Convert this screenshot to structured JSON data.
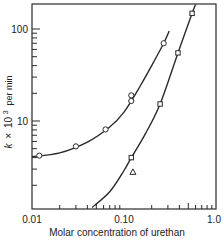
{
  "chart_data": {
    "type": "scatter",
    "title": "",
    "xlabel": "Molar concentration of urethan",
    "ylabel": "k × 10³ per min",
    "ylabel_parts": {
      "k": "k",
      "times": "×",
      "base": "10",
      "exp": "3",
      "unit": "per min"
    },
    "x_scale": "log",
    "y_scale": "log",
    "xlim": [
      0.01,
      1.0
    ],
    "ylim": [
      1.1,
      187
    ],
    "grid": false,
    "legend": null,
    "x_tick_labels": [
      "0.01",
      "0.10",
      "1.0"
    ],
    "x_ticks": [
      0.01,
      0.1,
      1.0
    ],
    "y_tick_labels": [
      "10",
      "100"
    ],
    "y_ticks": [
      10,
      100
    ],
    "series": [
      {
        "name": "circles",
        "marker": "circle",
        "points": [
          {
            "x": 0.012,
            "y": 4.2
          },
          {
            "x": 0.03,
            "y": 5.3
          },
          {
            "x": 0.063,
            "y": 8.1
          },
          {
            "x": 0.12,
            "y": 19
          },
          {
            "x": 0.12,
            "y": 16.5
          },
          {
            "x": 0.27,
            "y": 70
          }
        ],
        "fit_curve": [
          {
            "x": 0.01,
            "y": 4.1
          },
          {
            "x": 0.02,
            "y": 4.5
          },
          {
            "x": 0.04,
            "y": 5.9
          },
          {
            "x": 0.07,
            "y": 8.6
          },
          {
            "x": 0.1,
            "y": 12.5
          },
          {
            "x": 0.15,
            "y": 24
          },
          {
            "x": 0.2,
            "y": 40
          },
          {
            "x": 0.27,
            "y": 70
          },
          {
            "x": 0.31,
            "y": 95
          }
        ]
      },
      {
        "name": "squares",
        "marker": "square",
        "points": [
          {
            "x": 0.12,
            "y": 4.0
          },
          {
            "x": 0.247,
            "y": 15.3
          },
          {
            "x": 0.386,
            "y": 55
          },
          {
            "x": 0.55,
            "y": 148
          }
        ],
        "fit_curve": [
          {
            "x": 0.045,
            "y": 1.15
          },
          {
            "x": 0.07,
            "y": 1.7
          },
          {
            "x": 0.1,
            "y": 2.9
          },
          {
            "x": 0.12,
            "y": 4.0
          },
          {
            "x": 0.17,
            "y": 7.2
          },
          {
            "x": 0.247,
            "y": 15.3
          },
          {
            "x": 0.386,
            "y": 55
          },
          {
            "x": 0.55,
            "y": 148
          },
          {
            "x": 0.6,
            "y": 185
          }
        ]
      },
      {
        "name": "triangles",
        "marker": "triangle",
        "points": [
          {
            "x": 0.125,
            "y": 2.8
          }
        ]
      }
    ]
  }
}
